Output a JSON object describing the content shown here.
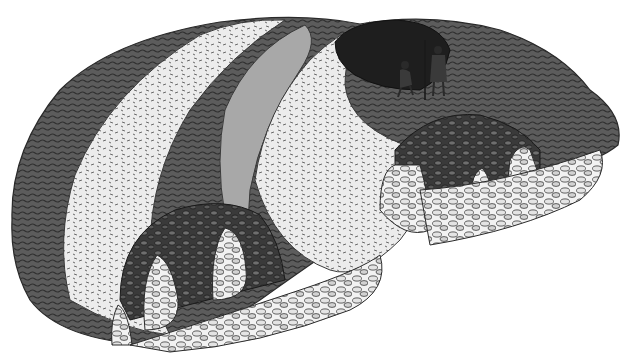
{
  "illustration": {
    "style": "grayscale pen-and-ink reconstruction drawing",
    "subject": "cut-away earthwork with curved stone-lined passages and corbelled arches",
    "colors": {
      "background": "#ffffff",
      "turf_dark": "#3a3a3a",
      "turf_mid": "#5c5c5c",
      "bank_light": "#e8e8e8",
      "bank_shade": "#a8a8a8",
      "stone_dark": "#2f2f2f",
      "stone_light": "#d9d9d9",
      "outline": "#1a1a1a"
    },
    "elements": {
      "outer_turf": "dark grassy outer ground",
      "left_bank": "light curved earthen bank (left)",
      "inner_bank": "light curved earthen bank (middle)",
      "pit": "dark hollow opening at top right",
      "left_passage": "stone passage with pillars (lower left)",
      "right_passage": "stone passage with pillars (right)",
      "figures": [
        {
          "label": "crouching figure"
        },
        {
          "label": "standing figure holding staff"
        }
      ]
    }
  }
}
